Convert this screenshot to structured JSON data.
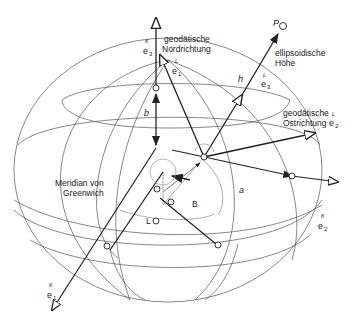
{
  "diagram": {
    "type": "geodetic-ellipsoid-coordinate-frames",
    "labels": {
      "geodetic_north": [
        "geodätische",
        "Nordrichtung"
      ],
      "ellipsoidal_height": [
        "ellipsoidische",
        "Höhe"
      ],
      "geodetic_east": [
        "geodätische",
        "Ostrichtung"
      ],
      "meridian": [
        "Meridian von",
        "Greenwich"
      ]
    },
    "symbols": {
      "P": "P",
      "h": "h",
      "b": "b",
      "a": "a",
      "B": "B",
      "L": "L"
    },
    "vectors": {
      "K_e3": {
        "sup": "K",
        "base": "e",
        "sub": "3"
      },
      "K_e1": {
        "sup": "K",
        "base": "e",
        "sub": "1"
      },
      "K_e2": {
        "sup": "K",
        "base": "e",
        "sub": "2"
      },
      "L_e1": {
        "sup": "L",
        "base": "e",
        "sub": "1"
      },
      "L_e2": {
        "sup": "L",
        "base": "e",
        "sub": "2"
      },
      "L_e3": {
        "sup": "L",
        "base": "e",
        "sub": "3"
      }
    },
    "colors": {
      "line": "#222222",
      "grid": "#555555",
      "construction": "#999999",
      "background": "#ffffff"
    }
  }
}
